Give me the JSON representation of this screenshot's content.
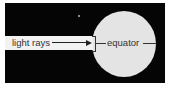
{
  "diagram": {
    "labels": {
      "light_rays": "light rays",
      "equator": "equator"
    },
    "colors": {
      "background": "#050505",
      "globe": "#e4e4e4",
      "rays_bar": "#f2f2f2",
      "line": "#333333"
    },
    "elements": [
      {
        "type": "space-background"
      },
      {
        "type": "globe"
      },
      {
        "type": "light-rays-band",
        "direction": "right"
      },
      {
        "type": "equator-line"
      }
    ]
  }
}
